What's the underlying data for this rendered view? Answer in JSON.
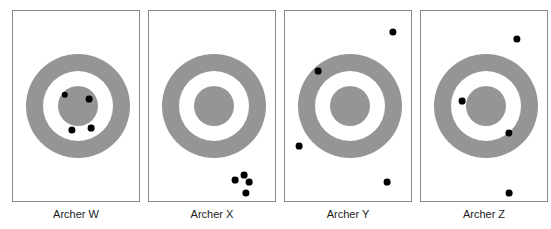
{
  "figure": {
    "title": "",
    "background_color": "#ffffff",
    "width": 551,
    "height": 229
  },
  "style": {
    "ring_color": "#959595",
    "gap_color": "#ffffff",
    "shot_color": "#000000",
    "panel_border_color": "#8c8c8c",
    "label_color": "#1a1a1a"
  },
  "chart_data": {
    "type": "scatter",
    "title": "",
    "xlabel": "",
    "ylabel": "",
    "target_geometry": {
      "outer_radius": 52,
      "middle_radius": 35,
      "inner_radius": 20,
      "center_x": 65,
      "center_y": 95
    },
    "panels": [
      {
        "label": "Archer W",
        "panel_x": 12,
        "panel_width": 128,
        "grouping": "tight cluster on inner disc",
        "shots": [
          {
            "x": 52,
            "y": 84,
            "r": 3.2
          },
          {
            "x": 76,
            "y": 88,
            "r": 3.4
          },
          {
            "x": 59,
            "y": 119,
            "r": 3.6
          },
          {
            "x": 78,
            "y": 117,
            "r": 3.4
          }
        ]
      },
      {
        "label": "Archer X",
        "panel_x": 148,
        "panel_width": 128,
        "grouping": "tight cluster off target, lower right",
        "shots": [
          {
            "x": 86,
            "y": 169,
            "r": 3.4
          },
          {
            "x": 95,
            "y": 164,
            "r": 3.4
          },
          {
            "x": 100,
            "y": 171,
            "r": 3.4
          },
          {
            "x": 97,
            "y": 182,
            "r": 3.6
          }
        ]
      },
      {
        "label": "Archer Y",
        "panel_x": 284,
        "panel_width": 128,
        "grouping": "widely scattered, off target",
        "shots": [
          {
            "x": 108,
            "y": 21,
            "r": 3.6
          },
          {
            "x": 33,
            "y": 60,
            "r": 3.4
          },
          {
            "x": 14,
            "y": 135,
            "r": 3.4
          },
          {
            "x": 102,
            "y": 171,
            "r": 3.4
          }
        ]
      },
      {
        "label": "Archer Z",
        "panel_x": 420,
        "panel_width": 128,
        "grouping": "scattered, some near centre",
        "shots": [
          {
            "x": 96,
            "y": 28,
            "r": 3.6
          },
          {
            "x": 41,
            "y": 90,
            "r": 3.4
          },
          {
            "x": 88,
            "y": 122,
            "r": 3.6
          },
          {
            "x": 88,
            "y": 182,
            "r": 3.4
          }
        ]
      }
    ]
  }
}
